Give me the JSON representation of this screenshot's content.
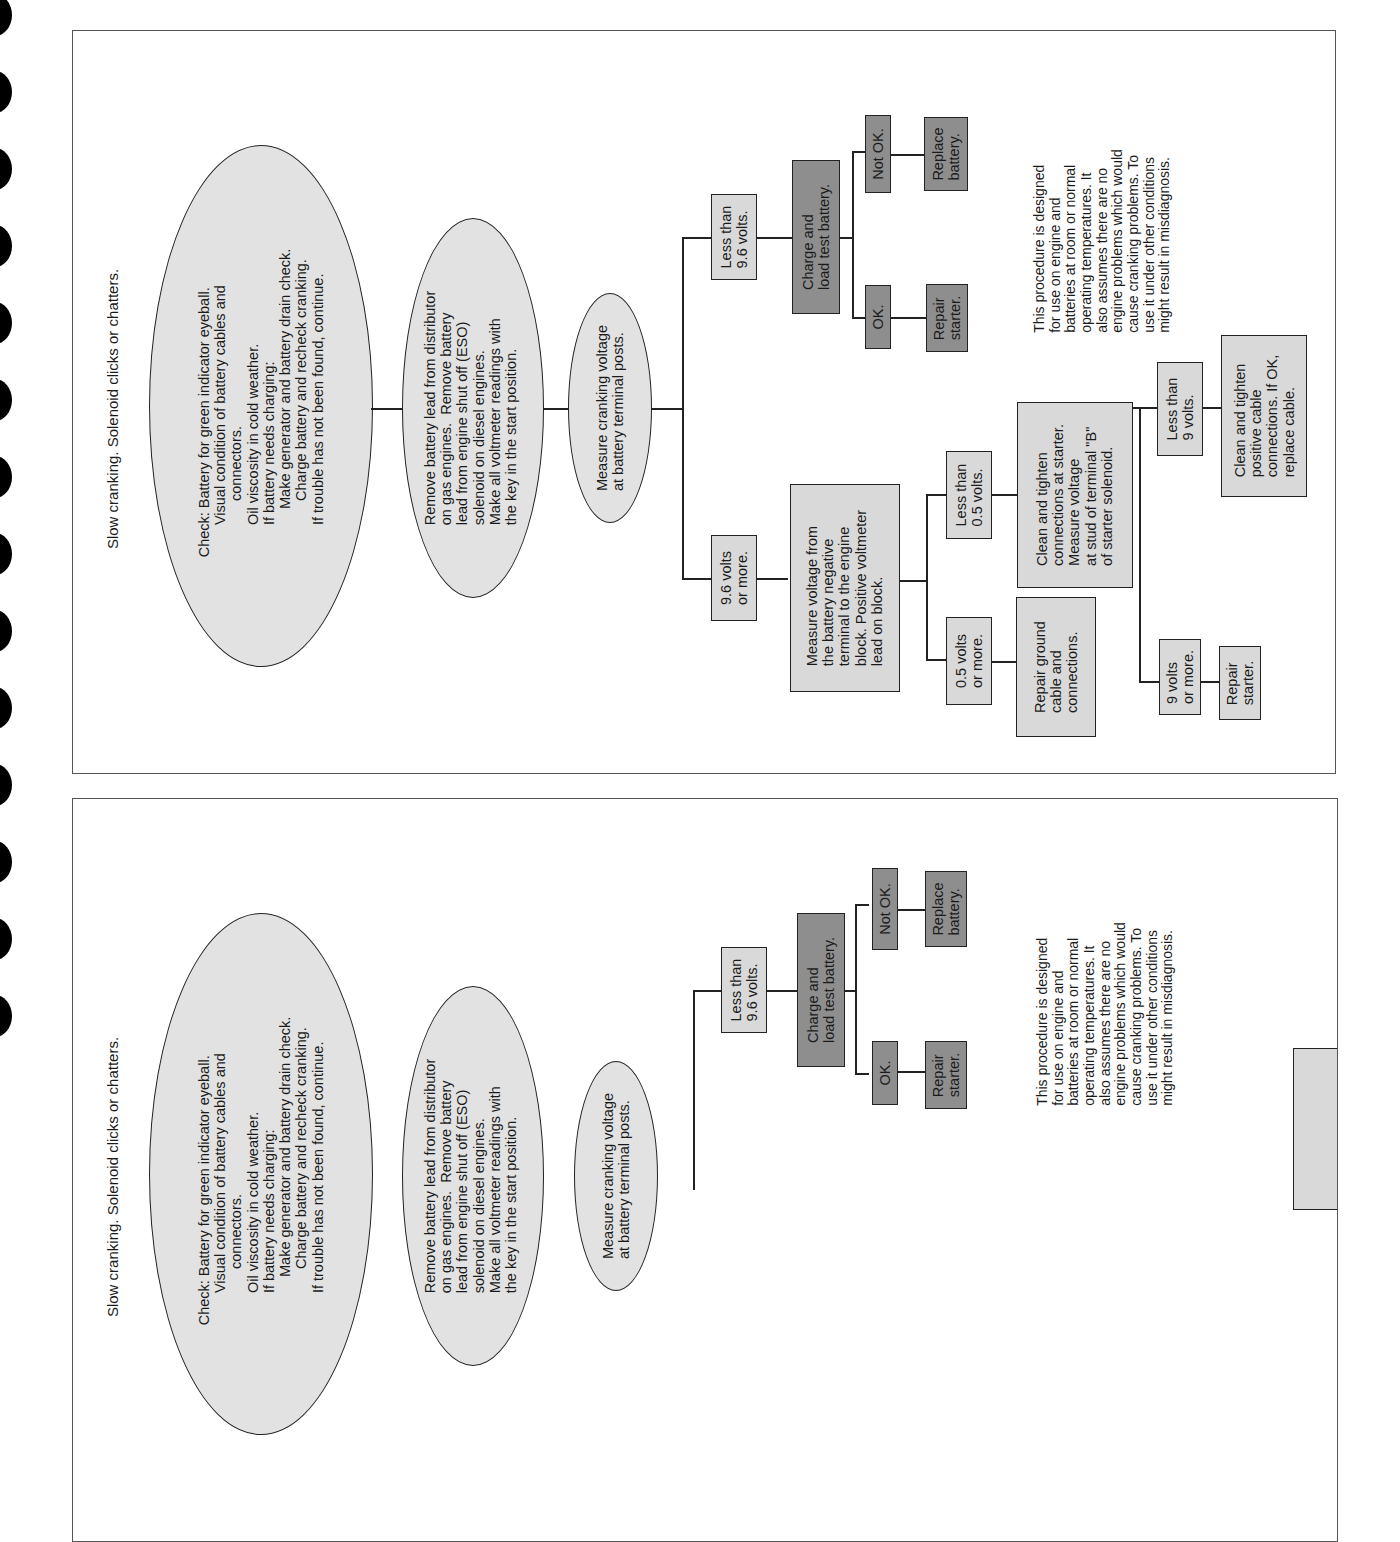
{
  "binder_holes": 14,
  "panels": [
    {
      "title": "Slow cranking. Solenoid clicks or chatters.",
      "steps": {
        "check": "Check: Battery for green indicator eyeball.\n        Visual condition of battery cables and\n              connectors.\n        Oil viscosity in cold weather.\n        If battery needs charging:\n            Make generator and battery drain check.\n              Charge battery and recheck cranking.\n        If trouble has not been found, continue.",
        "remove_lead": "Remove battery lead from distributor\non gas engines.  Remove battery\nlead from engine shut off (ESO)\nsolenoid on diesel engines.\nMake all voltmeter readings with\nthe key in the start position.",
        "measure_cranking": "Measure cranking voltage\nat battery terminal posts.",
        "less_9_6": "Less than\n9.6 volts.",
        "charge_load": "Charge and\nload test battery.",
        "ok": "OK.",
        "not_ok": "Not OK.",
        "repair_starter_1": "Repair\nstarter.",
        "replace_battery": "Replace\nbattery.",
        "more_9_6": "9.6 volts\nor more.",
        "measure_negative": "Measure voltage from\nthe battery negative\nterminal to the engine\nblock. Positive voltmeter\nlead on block.",
        "more_0_5": "0.5 volts\nor more.",
        "repair_ground": "Repair ground\ncable and\nconnections.",
        "less_0_5": "Less than\n0.5 volts.",
        "clean_starter": "Clean and tighten\nconnections at starter.\nMeasure voltage\nat stud of terminal \"B\"\nof starter solenoid.",
        "less_9": "Less than\n9 volts.",
        "clean_positive": "Clean and tighten\npositive cable\nconnections. If OK,\nreplace cable.",
        "more_9": "9 volts\nor more.",
        "repair_starter_2": "Repair\nstarter."
      },
      "note": "This procedure is designed\nfor use on engine and\nbatteries at room or normal\noperating temperatures. It\nalso assumes there are no\nengine problems which would\ncause cranking problems. To\nuse it under other conditions\nmight result in misdiagnosis."
    }
  ],
  "colors": {
    "ellipse_fill": "#e2e2e2",
    "light_box": "#d9d9d9",
    "dark_box": "#8e8e8e",
    "line": "#222222"
  }
}
